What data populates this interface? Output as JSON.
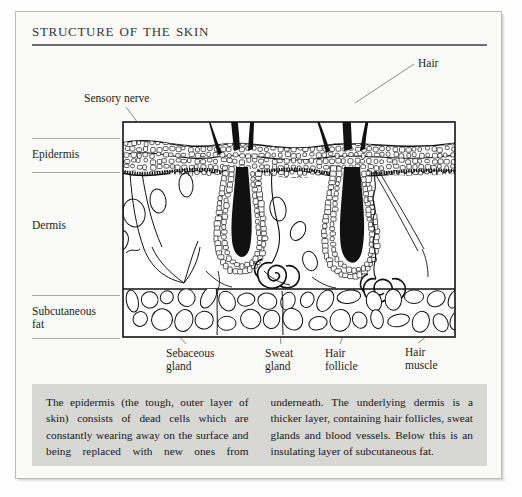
{
  "page": {
    "title": "Structure of the Skin"
  },
  "layer_labels": [
    {
      "name": "epidermis",
      "text": "Epidermis"
    },
    {
      "name": "dermis",
      "text": "Dermis"
    },
    {
      "name": "subcutaneous-fat",
      "text": "Subcutaneous\nfat"
    }
  ],
  "callouts": [
    {
      "name": "sensory-nerve",
      "text": "Sensory nerve"
    },
    {
      "name": "hair",
      "text": "Hair"
    },
    {
      "name": "sebaceous-gland",
      "text": "Sebaceous\ngland"
    },
    {
      "name": "sweat-gland",
      "text": "Sweat\ngland"
    },
    {
      "name": "hair-follicle",
      "text": "Hair\nfollicle"
    },
    {
      "name": "hair-muscle",
      "text": "Hair\nmuscle"
    }
  ],
  "caption": {
    "column_1": "The epidermis (the tough, outer layer of skin) consists of dead cells which are constantly wearing away on the surface and being replaced with new ones from",
    "column_2": "underneath. The underlying dermis is a thicker layer, containing hair follicles, sweat glands and blood vessels. Below this is an insulating layer of subcutaneous fat."
  },
  "colors": {
    "page_background": "#fafaf8",
    "frame_border": "#b9b9b6",
    "title_text": "#35353a",
    "title_rule": "#6d6d72",
    "ink": "#111111",
    "caption_background": "#d7d7d4",
    "leader_line": "#6f6f73"
  }
}
